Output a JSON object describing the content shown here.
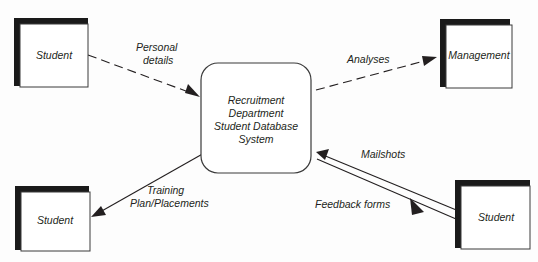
{
  "diagram": {
    "type": "data-flow-context-diagram",
    "background_color": "#fdfdfd",
    "line_color": "#231f20",
    "shadow_color": "#1a1a1a",
    "entity_fill": "#ffffff",
    "process": {
      "id": "process-central",
      "shape": "rounded-rectangle",
      "lines": [
        "Recruitment",
        "Department",
        "Student Database",
        "System"
      ]
    },
    "entities": [
      {
        "id": "entity-student-top-left",
        "label": "Student",
        "position": "top-left"
      },
      {
        "id": "entity-management-top-right",
        "label": "Management",
        "position": "top-right"
      },
      {
        "id": "entity-student-bottom-left",
        "label": "Student",
        "position": "bottom-left"
      },
      {
        "id": "entity-student-bottom-right",
        "label": "Student",
        "position": "bottom-right"
      }
    ],
    "flows": [
      {
        "id": "flow-personal-details",
        "label_lines": [
          "Personal",
          "details"
        ],
        "style": "dashed",
        "from": "entity-student-top-left",
        "to": "process-central"
      },
      {
        "id": "flow-analyses",
        "label_lines": [
          "Analyses"
        ],
        "style": "dashed",
        "from": "process-central",
        "to": "entity-management-top-right"
      },
      {
        "id": "flow-training-plan",
        "label_lines": [
          "Training",
          "Plan/Placements"
        ],
        "style": "solid",
        "from": "process-central",
        "to": "entity-student-bottom-left"
      },
      {
        "id": "flow-mailshots",
        "label_lines": [
          "Mailshots"
        ],
        "style": "solid",
        "from": "entity-student-bottom-right",
        "to": "process-central"
      },
      {
        "id": "flow-feedback-forms",
        "label_lines": [
          "Feedback forms"
        ],
        "style": "solid",
        "from": "process-central",
        "to": "entity-student-bottom-right"
      }
    ]
  }
}
